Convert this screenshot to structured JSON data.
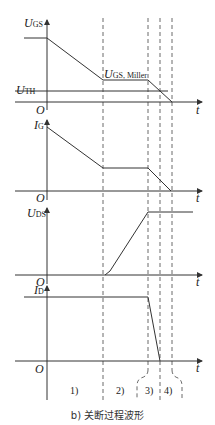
{
  "caption": "b) 关断过程波形",
  "panels": [
    {
      "id": "ugs",
      "y_label_main": "U",
      "y_label_sub": "GS",
      "x_label": "t",
      "origin": "O",
      "annotations": {
        "threshold_main": "U",
        "threshold_sub": "TH",
        "miller_main": "U",
        "miller_sub": "GS",
        "miller_suffix": ", Miller"
      }
    },
    {
      "id": "ig",
      "y_label_main": "I",
      "y_label_sub": "G",
      "x_label": "t",
      "origin": "O"
    },
    {
      "id": "uds",
      "y_label_main": "U",
      "y_label_sub": "DS",
      "x_label": "t",
      "origin": "O"
    },
    {
      "id": "id",
      "y_label_main": "I",
      "y_label_sub": "D",
      "x_label": "t",
      "origin": "O"
    }
  ],
  "regions": [
    "1)",
    "2)",
    "3)",
    "4)"
  ],
  "colors": {
    "line": "#333333",
    "dash": "#444444",
    "background": "#ffffff"
  }
}
